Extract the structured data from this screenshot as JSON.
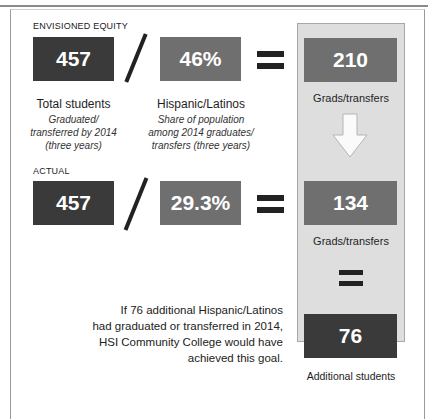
{
  "envisioned": {
    "label": "ENVISIONED EQUITY",
    "total": {
      "value": "457",
      "caption": "Total students",
      "sub_lines": [
        "Graduated/",
        "transferred by 2014",
        "(three years)"
      ]
    },
    "share": {
      "value": "46%",
      "caption": "Hispanic/Latinos",
      "sub_lines": [
        "Share of population",
        "among 2014 graduates/",
        "transfers (three years)"
      ]
    },
    "result": {
      "value": "210",
      "caption": "Grads/transfers"
    }
  },
  "actual": {
    "label": "ACTUAL",
    "total": {
      "value": "457"
    },
    "share": {
      "value": "29.3%"
    },
    "result": {
      "value": "134",
      "caption": "Grads/transfers"
    }
  },
  "gap": {
    "value": "76",
    "caption": "Additional students",
    "note_lines": [
      "If 76 additional Hispanic/Latinos",
      "had graduated or transferred in 2014,",
      "HSI Community College would have",
      "achieved this goal."
    ]
  },
  "colors": {
    "dark_box": "#3a3a3a",
    "mid_box": "#6f6f6f",
    "panel": "#dedede",
    "text": "#222222"
  },
  "icons": {
    "divide": "slash-operator",
    "equals": "equals-operator",
    "arrow": "down-arrow"
  }
}
